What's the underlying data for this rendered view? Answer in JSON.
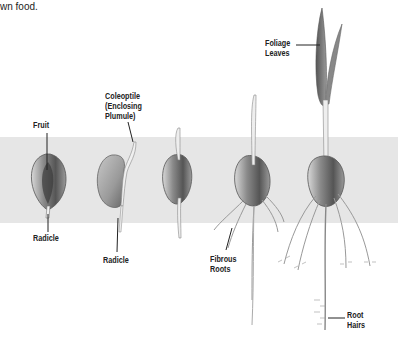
{
  "intro_text": {
    "cut_line": "",
    "visible_line": "wn food."
  },
  "labels": {
    "fruit": "Fruit",
    "radicle_1": "Radicle",
    "coleoptile_1": "Coleoptile",
    "coleoptile_2": "(Enclosing",
    "coleoptile_3": "Plumule)",
    "radicle_2": "Radicle",
    "fibrous_1": "Fibrous",
    "fibrous_2": "Roots",
    "foliage_1": "Foliage",
    "foliage_2": "Leaves",
    "roothairs_1": "Root",
    "roothairs_2": "Hairs"
  },
  "stages": [
    {
      "name": "stage-1-fruit-radicle"
    },
    {
      "name": "stage-2-coleoptile"
    },
    {
      "name": "stage-3-elongation"
    },
    {
      "name": "stage-4-fibrous-roots"
    },
    {
      "name": "stage-5-foliage-leaves"
    }
  ]
}
